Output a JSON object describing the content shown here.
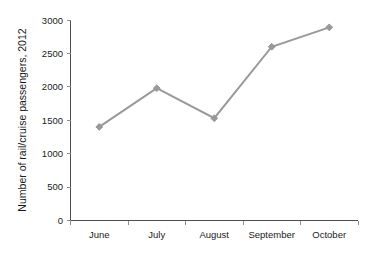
{
  "chart_data": {
    "type": "line",
    "title": "",
    "subtitle": "",
    "xlabel": "",
    "ylabel": "Number of rail/cruise passengers, 2012",
    "categories": [
      "June",
      "July",
      "August",
      "September",
      "October"
    ],
    "values": [
      1400,
      1980,
      1530,
      2600,
      2890
    ],
    "series": [
      {
        "name": "Number of rail/cruise passengers, 2012",
        "values": [
          1400,
          1980,
          1530,
          2600,
          2890
        ]
      }
    ],
    "ylim": [
      0,
      3000
    ],
    "ytick_labels": [
      "0",
      "500",
      "1000",
      "1500",
      "2000",
      "2500",
      "3000"
    ],
    "ytick_values": [
      0,
      500,
      1000,
      1500,
      2000,
      2500,
      3000
    ],
    "xtick_labels": [
      "June",
      "July",
      "August",
      "September",
      "October"
    ],
    "grid": false,
    "legend": false,
    "legend_position": "none",
    "marker": "diamond",
    "series_color": "#999999",
    "axis_color": "#4d4d4d",
    "tick_color": "#8c8c8c",
    "text_color": "#1a1a1a",
    "background_color": "#ffffff",
    "annotations": []
  }
}
